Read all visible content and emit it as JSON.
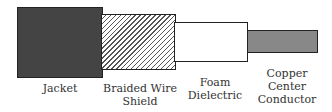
{
  "diagram": {
    "parts": [
      {
        "id": "jacket",
        "label_lines": [
          "Jacket"
        ],
        "fill": "#444444"
      },
      {
        "id": "braid",
        "label_lines": [
          "Braided Wire",
          "Shield"
        ],
        "fill": "hatched"
      },
      {
        "id": "foam",
        "label_lines": [
          "Foam",
          "Dielectric"
        ],
        "fill": "#ffffff"
      },
      {
        "id": "copper",
        "label_lines": [
          "Copper",
          "Center",
          "Conductor"
        ],
        "fill": "#888888"
      }
    ]
  }
}
